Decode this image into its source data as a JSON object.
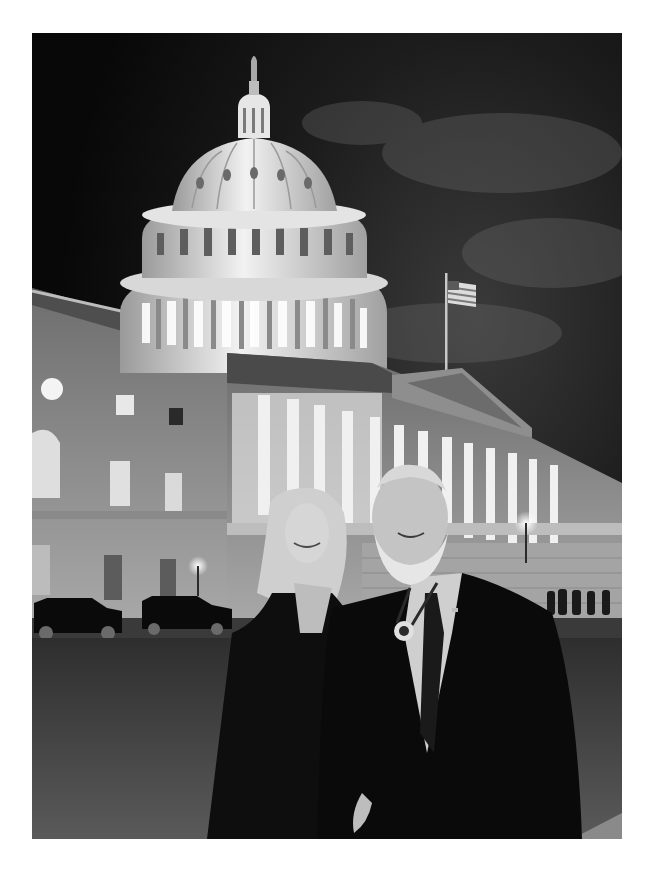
{
  "photo": {
    "alt": "Black-and-white night photograph of a smiling couple standing in front of the illuminated U.S. Capitol building",
    "subject": "Couple posing in front of the U.S. Capitol at night",
    "style": "monochrome",
    "elements": {
      "sky": "dark night sky with clouds",
      "building": "U.S. Capitol with illuminated dome and columned east front",
      "flag": "American flag on flagpole",
      "vehicles": "two black SUVs parked at left",
      "people_background": "small group of people near steps at right",
      "foreground_left": "woman with long blonde hair in dark coat",
      "foreground_right": "man with white beard in dark suit wearing a medal on a ribbon"
    },
    "colors": {
      "sky": "#0d0d0d",
      "dome": "#e6e6e6",
      "building": "#9a9a9a",
      "coat": "#0a0a0a",
      "lawn": "#4a4a4a",
      "border": "#ffffff"
    }
  }
}
